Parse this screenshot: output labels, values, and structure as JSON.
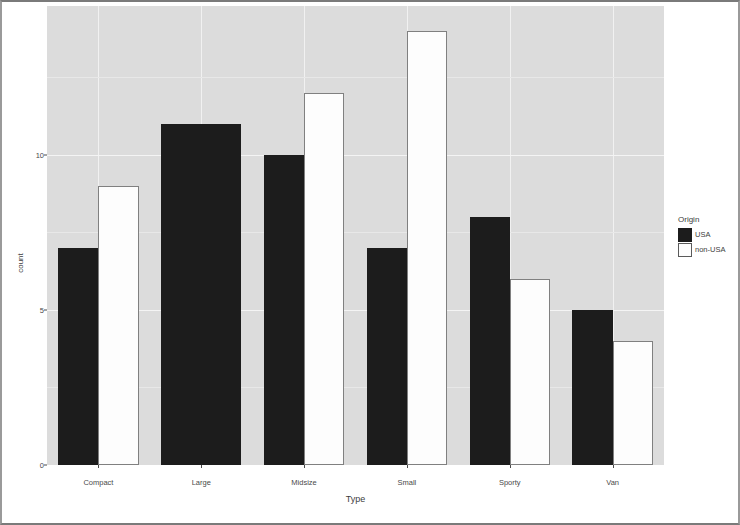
{
  "chart_data": {
    "type": "bar",
    "title": "",
    "subtitle": "",
    "xlabel": "Type",
    "ylabel": "count",
    "categories": [
      "Compact",
      "Large",
      "Midsize",
      "Small",
      "Sporty",
      "Van"
    ],
    "series": [
      {
        "name": "USA",
        "color": "#1c1c1c",
        "values": [
          7,
          11,
          10,
          7,
          8,
          5
        ]
      },
      {
        "name": "non-USA",
        "color": "#ffffff",
        "values": [
          9,
          0,
          12,
          14,
          6,
          4
        ]
      }
    ],
    "legend": {
      "title": "Origin",
      "position": "right",
      "entries": [
        "USA",
        "non-USA"
      ]
    },
    "yticks": [
      0,
      5,
      10
    ],
    "ytick_labels": [
      "0",
      "5",
      "10"
    ],
    "yminor": [
      2.5,
      7.5,
      12.5
    ],
    "ylim": [
      0,
      14.8
    ],
    "xlim_categories": 6,
    "grid": true,
    "grid_style": "ggplot2-grey-panel",
    "bar_position": "dodge"
  },
  "axes": {
    "y_label": "count",
    "x_label": "Type"
  }
}
